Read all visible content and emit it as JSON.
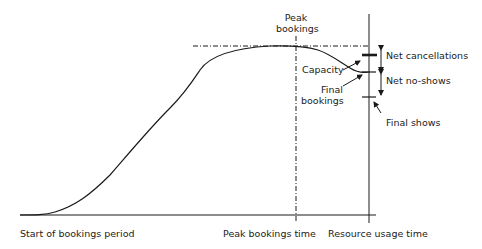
{
  "diagram": {
    "type": "booking-curve",
    "labels": {
      "peak_bookings": [
        "Peak",
        "bookings"
      ],
      "net_cancellations": "Net cancellations",
      "capacity": "Capacity",
      "net_no_shows": "Net no-shows",
      "final_bookings": [
        "Final",
        "bookings"
      ],
      "final_shows": "Final shows",
      "x_start": "Start of bookings period",
      "x_peak_time": "Peak bookings time",
      "x_resource_time": "Resource usage time"
    },
    "colors": {
      "line": "#1a1a1a",
      "text": "#222222",
      "background": "#ffffff"
    }
  }
}
